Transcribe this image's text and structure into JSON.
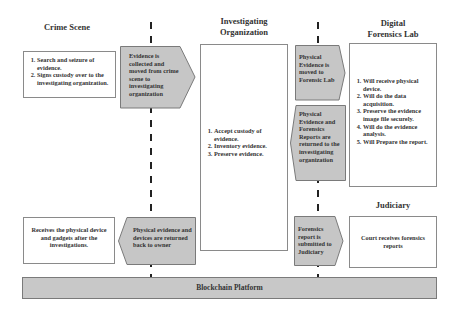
{
  "columns": {
    "crime_scene": {
      "title": "Crime Scene"
    },
    "investigating_org": {
      "title_line1": "Investigating",
      "title_line2": "Organization"
    },
    "forensics_lab": {
      "title_line1": "Digital",
      "title_line2": "Forensics Lab"
    },
    "judiciary": {
      "title": "Judiciary"
    }
  },
  "boxes": {
    "crime_scene_tasks": [
      "Search and seizure of evidence.",
      "Signs custody over to the investigating organization."
    ],
    "investigating_org_tasks": [
      "Accept custody of evidence.",
      "Inventory evidence.",
      "Preserve evidence."
    ],
    "forensics_lab_tasks": [
      "Will receive physical device.",
      "Will do the data acquisition.",
      "Preserve the evidence image file securely.",
      "Will do the evidence analysis.",
      "Will Prepare the report."
    ],
    "owner_return": "Receives the physical device and gadgets after the investigations.",
    "court": "Court receives forensics reports"
  },
  "arrows": {
    "to_investigating_org": "Evidence is collected and moved from crime scene to investigating organization",
    "to_forensic_lab": "Physical Evidence is moved to Forensic Lab",
    "back_to_investigating_org": "Physical Evidence and Forensics Reports are returned to the investigating organization",
    "back_to_owner": "Physical evidence and devices are returned back to owner",
    "to_judiciary": "Forensics report is submitted to Judiciary"
  },
  "platform": {
    "label": "Blockchain Platform"
  },
  "colors": {
    "arrow_fill": "#c6c6c6",
    "arrow_stroke": "#7a7a7a",
    "bar_fill": "#c8c8c8",
    "box_border": "#8a8a8a"
  }
}
